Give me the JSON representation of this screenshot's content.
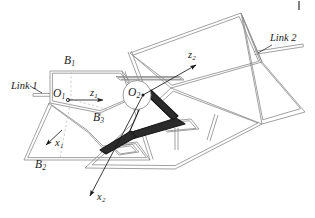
{
  "figure": {
    "type": "engineering-line-diagram",
    "background_color": "#ffffff",
    "line_color": "#8a8a8a",
    "accent_color": "#1a1a1a",
    "hidden_line_color": "#b5b5b5",
    "text_color": "#1a1a1a"
  },
  "labels": {
    "link1": {
      "text": "Link 1",
      "base": "Link",
      "index": "1"
    },
    "link2": {
      "text": "Link 2",
      "base": "Link",
      "index": "2"
    },
    "B1": {
      "base": "B",
      "index": "1"
    },
    "B2": {
      "base": "B",
      "index": "2"
    },
    "B3": {
      "base": "B",
      "index": "3"
    },
    "O1": {
      "base": "O",
      "index": "1"
    },
    "O2": {
      "base": "O",
      "index": "2"
    },
    "z1": {
      "base": "z",
      "index": "1"
    },
    "z2": {
      "base": "z",
      "index": "2"
    },
    "x1": {
      "base": "x",
      "index": "1"
    },
    "x2": {
      "base": "x",
      "index": "2"
    }
  },
  "frames": [
    {
      "name": "frame-1",
      "origin": "O1",
      "axes": [
        "z1",
        "x1"
      ]
    },
    {
      "name": "frame-2",
      "origin": "O2",
      "axes": [
        "z2",
        "x2"
      ]
    }
  ],
  "attachment_points": [
    "B1",
    "B2",
    "B3"
  ]
}
